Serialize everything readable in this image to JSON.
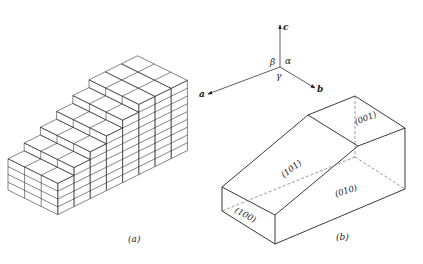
{
  "figure": {
    "panel_a": {
      "caption": "(a)",
      "description": "stepped stack of unit cells",
      "steps": 6,
      "depth_cells": 3
    },
    "panel_b": {
      "caption": "(b)",
      "axes": {
        "a": "a",
        "b": "b",
        "c": "c"
      },
      "angles": {
        "alpha": "α",
        "beta": "β",
        "gamma": "γ"
      },
      "faces": {
        "f001": "(001)",
        "f101": "(101)",
        "f010": "(010)",
        "f100": "(100)"
      }
    }
  }
}
